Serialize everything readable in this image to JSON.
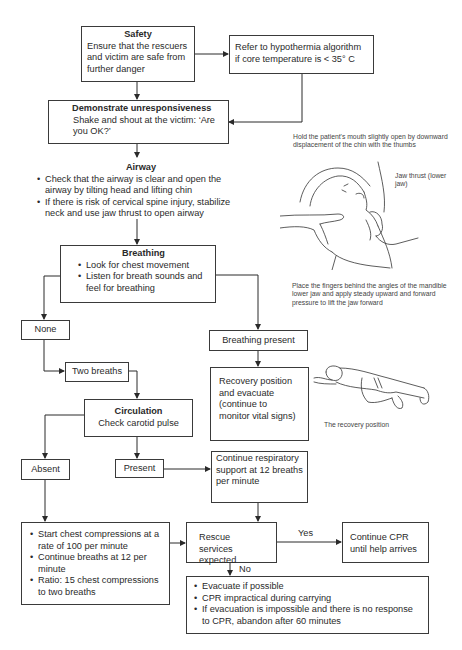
{
  "flowchart": {
    "safety": {
      "title": "Safety",
      "text": "Ensure that the rescuers and victim are safe from further danger"
    },
    "hypothermia": {
      "text": "Refer to hypothermia algorithm if core temperature is < 35° C"
    },
    "unresponsiveness": {
      "title": "Demonstrate unresponsiveness",
      "text": "Shake and shout at the victim: ‘Are you OK?’"
    },
    "airway": {
      "title": "Airway",
      "bullets": [
        "Check that the airway is clear and open the airway by tilting head and lifting chin",
        "If there is risk of cervical spine injury, stabilize neck and use jaw thrust to open airway"
      ]
    },
    "breathing": {
      "title": "Breathing",
      "bullets": [
        "Look for chest movement",
        "Listen for breath sounds and feel for breathing"
      ]
    },
    "none": {
      "label": "None"
    },
    "breathing_present": {
      "label": "Breathing present"
    },
    "recovery": {
      "text": "Recovery position and evacuate (continue to monitor vital signs)"
    },
    "two_breaths": {
      "label": "Two breaths"
    },
    "circulation": {
      "title": "Circulation",
      "text": "Check carotid pulse"
    },
    "absent": {
      "label": "Absent"
    },
    "present": {
      "label": "Present"
    },
    "continue_resp": {
      "text": "Continue respiratory support at 12 breaths per minute"
    },
    "chest_compressions": {
      "bullets": [
        "Start chest compressions at a rate of 100 per minute",
        "Continue breaths at 12 per minute",
        "Ratio: 15 chest compressions to two breaths"
      ]
    },
    "rescue_services": {
      "text": "Rescue services expected"
    },
    "continue_cpr": {
      "text": "Continue CPR until help arrives"
    },
    "evacuate": {
      "bullets": [
        "Evacuate if possible",
        "CPR impractical during carrying",
        "If evacuation is impossible and there is no response to CPR, abandon after 60 minutes"
      ]
    },
    "edge_labels": {
      "yes": "Yes",
      "no": "No"
    }
  },
  "illustrations": {
    "jaw_thrust": {
      "caption_top": "Hold the patient's mouth slightly open by downward displacement of the chin with the thumbs",
      "label": "Jaw thrust (lower jaw)",
      "caption_bottom": "Place the fingers behind the angles of the mandible lower jaw and apply steady upward and forward pressure to lift the jaw forward"
    },
    "recovery_position": {
      "caption": "The recovery position"
    }
  }
}
